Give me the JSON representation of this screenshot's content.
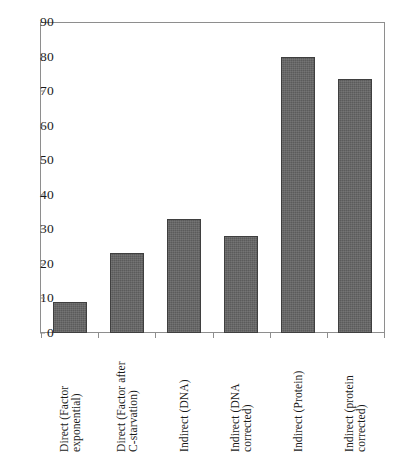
{
  "chart_data": {
    "type": "bar",
    "title": "",
    "subtitle": "",
    "xlabel": "",
    "ylabel": "",
    "ylim": [
      0,
      90
    ],
    "ytick_step": 10,
    "yticks": [
      90,
      80,
      70,
      60,
      50,
      40,
      30,
      20,
      10,
      0
    ],
    "grid": false,
    "legend": null,
    "legend_position": "none",
    "bar_color": "#5b5b5b",
    "bar_edge_color": "#3f3f3f",
    "axis_color": "#8e8e8e",
    "plot_background": "#ffffff",
    "categories": [
      "Direct (Factor exponential)",
      "Direct (Factor after C-starvation)",
      "Indirect (DNA)",
      "Indirect (DNA corrected)",
      "Indirect (Protein)",
      "Indirect (protein corrected)"
    ],
    "category_lines": [
      [
        "Direct (Factor",
        "exponential)"
      ],
      [
        "Direct (Factor after",
        "C-starvation)"
      ],
      [
        "Indirect (DNA)",
        ""
      ],
      [
        "Indirect (DNA",
        "corrected)"
      ],
      [
        "Indirect (Protein)",
        ""
      ],
      [
        "Indirect (protein",
        "corrected)"
      ]
    ],
    "values": [
      9,
      23.3,
      33,
      28,
      80,
      73.5
    ]
  }
}
